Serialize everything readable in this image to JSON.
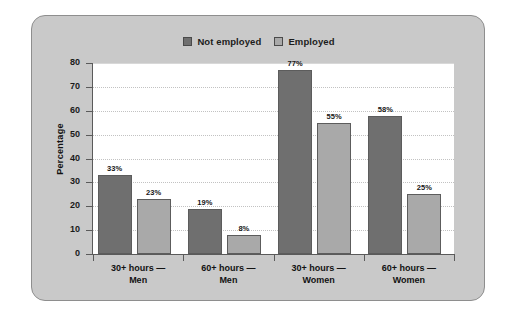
{
  "chart_data": {
    "type": "bar",
    "title": "",
    "xlabel": "",
    "ylabel": "Percentage",
    "ylim": [
      0,
      80
    ],
    "ytick_step": 10,
    "yticks": [
      "0",
      "10",
      "20",
      "30",
      "40",
      "50",
      "60",
      "70",
      "80"
    ],
    "grid": true,
    "legend_position": "top-center",
    "categories": [
      "30+ hours —\nMen",
      "60+ hours —\nMen",
      "30+ hours —\nWomen",
      "60+ hours —\nWomen"
    ],
    "category_lines": [
      [
        "30+ hours —",
        "Men"
      ],
      [
        "60+ hours —",
        "Men"
      ],
      [
        "30+ hours —",
        "Women"
      ],
      [
        "60+ hours —",
        "Women"
      ]
    ],
    "series": [
      {
        "name": "Not employed",
        "color": "#6f6f6f",
        "values": [
          33,
          19,
          77,
          58
        ],
        "labels": [
          "33%",
          "19%",
          "77%",
          "58%"
        ]
      },
      {
        "name": "Employed",
        "color": "#a9a9a9",
        "values": [
          23,
          8,
          55,
          25
        ],
        "labels": [
          "23%",
          "8%",
          "55%",
          "25%"
        ]
      }
    ]
  },
  "legend": {
    "entries": [
      {
        "label": "Not employed",
        "color": "#6f6f6f"
      },
      {
        "label": "Employed",
        "color": "#a9a9a9"
      }
    ]
  },
  "axes": {
    "y_title": "Percentage"
  },
  "colors": {
    "panel_background": "#c9c9c9",
    "panel_border": "#8e8e8e",
    "plot_background": "#ffffff",
    "gridline": "#c2c2c2",
    "axis": "#5a5a5a",
    "series_not_employed": "#6f6f6f",
    "series_employed": "#a9a9a9",
    "text": "#121212"
  }
}
